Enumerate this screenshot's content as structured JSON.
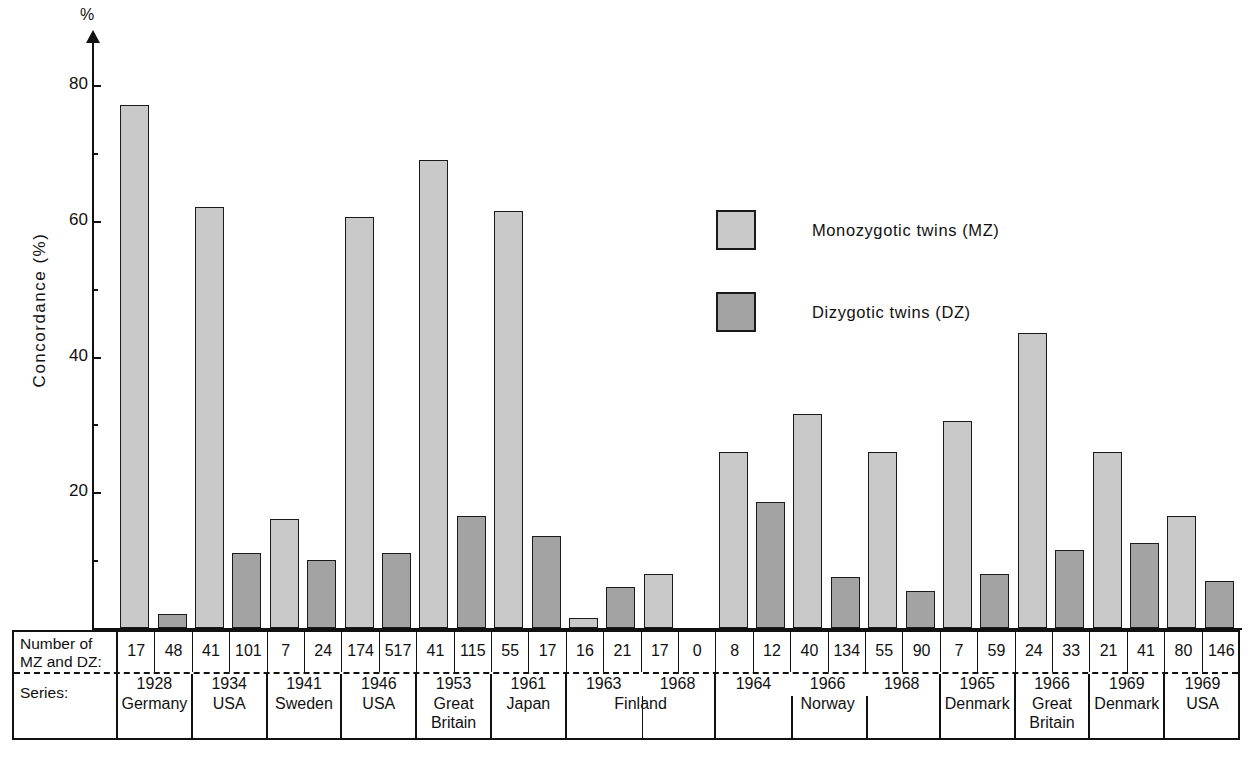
{
  "chart_data": {
    "type": "bar",
    "title": "",
    "xlabel": "",
    "ylabel": "Concordance  (%)",
    "unit_symbol": "%",
    "ylim": [
      0,
      88
    ],
    "yticks": [
      20,
      40,
      60,
      80
    ],
    "ytick_labels": [
      "20",
      "40",
      "60",
      "80"
    ],
    "minor_ticks": [
      10,
      30,
      50,
      70
    ],
    "grid": false,
    "legend_position": "upper-right-inside",
    "series": [
      {
        "name": "Monozygotic twins (MZ)",
        "color": "#c9c9c9",
        "values": [
          77,
          62,
          16,
          60.5,
          69,
          61.5,
          1.5,
          8,
          26,
          31.5,
          26,
          30.5,
          43.5,
          26,
          16.5
        ]
      },
      {
        "name": "Dizygotic twins  (DZ)",
        "color": "#a3a3a3",
        "values": [
          2,
          11,
          10,
          11,
          16.5,
          13.5,
          6,
          0,
          18.5,
          7.5,
          5.5,
          8,
          11.5,
          12.5,
          7
        ]
      }
    ],
    "categories": [
      "1928 Germany",
      "1934 USA",
      "1941 Sweden",
      "1946 USA",
      "1953 Great Britain",
      "1961 Japan",
      "1963 Finland",
      "1968 Finland",
      "1964 Norway",
      "1966 Norway",
      "1968 Norway",
      "1965 Denmark",
      "1966 Great Britain",
      "1969 Denmark",
      "1969 USA"
    ]
  },
  "legend": {
    "items": [
      {
        "swatch": "mz",
        "label": "Monozygotic  twins (MZ)"
      },
      {
        "swatch": "dz",
        "label": "Dizygotic  twins      (DZ)"
      }
    ]
  },
  "axis": {
    "unit_symbol": "%",
    "title": "Concordance    (%)",
    "ticks": [
      {
        "label": "80"
      },
      {
        "label": "60"
      },
      {
        "label": "40"
      },
      {
        "label": "20"
      }
    ]
  },
  "table": {
    "row_header": {
      "line1": "Number of",
      "line2": "MZ and  DZ:",
      "line3": "Series:"
    },
    "groups": [
      {
        "year": "1928",
        "country": "Germany",
        "mz": "17",
        "dz": "48"
      },
      {
        "year": "1934",
        "country": "USA",
        "mz": "41",
        "dz": "101"
      },
      {
        "year": "1941",
        "country": "Sweden",
        "mz": "7",
        "dz": "24"
      },
      {
        "year": "1946",
        "country": "USA",
        "mz": "174",
        "dz": "517"
      },
      {
        "year": "1953",
        "country": "Great Britain",
        "mz": "41",
        "dz": "115"
      },
      {
        "year": "1961",
        "country": "Japan",
        "mz": "55",
        "dz": "17"
      },
      {
        "year": "1963",
        "country": "Finland",
        "mz": "16",
        "dz": "21"
      },
      {
        "year": "1968",
        "country": "Finland",
        "mz": "17",
        "dz": "0"
      },
      {
        "year": "1964",
        "country": "Norway",
        "mz": "8",
        "dz": "12"
      },
      {
        "year": "1966",
        "country": "Norway",
        "mz": "40",
        "dz": "134"
      },
      {
        "year": "1968",
        "country": "Norway",
        "mz": "55",
        "dz": "90"
      },
      {
        "year": "1965",
        "country": "Denmark",
        "mz": "7",
        "dz": "59"
      },
      {
        "year": "1966",
        "country": "Great Britain",
        "mz": "24",
        "dz": "33"
      },
      {
        "year": "1969",
        "country": "Denmark",
        "mz": "21",
        "dz": "41"
      },
      {
        "year": "1969",
        "country": "USA",
        "mz": "80",
        "dz": "146"
      }
    ],
    "country_spans": [
      {
        "country": "Germany",
        "start": 0,
        "count": 1
      },
      {
        "country": "USA",
        "start": 1,
        "count": 1
      },
      {
        "country": "Sweden",
        "start": 2,
        "count": 1
      },
      {
        "country": "USA",
        "start": 3,
        "count": 1
      },
      {
        "country": "Great Britain",
        "start": 4,
        "count": 1
      },
      {
        "country": "Japan",
        "start": 5,
        "count": 1
      },
      {
        "country": "Finland",
        "start": 6,
        "count": 2
      },
      {
        "country": "Norway",
        "start": 8,
        "count": 3
      },
      {
        "country": "Denmark",
        "start": 11,
        "count": 1
      },
      {
        "country": "Great Britain",
        "start": 12,
        "count": 1
      },
      {
        "country": "Denmark",
        "start": 13,
        "count": 1
      },
      {
        "country": "USA",
        "start": 14,
        "count": 1
      }
    ]
  }
}
